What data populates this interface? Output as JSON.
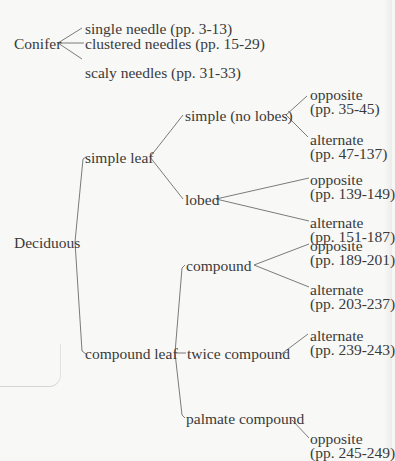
{
  "title_fragment": "",
  "tree": {
    "conifer": {
      "label": "Conifer",
      "children": [
        {
          "label": "single needle (pp. 3-13)"
        },
        {
          "label": "clustered needles (pp. 15-29)"
        },
        {
          "label": "scaly needles (pp. 31-33)"
        }
      ]
    },
    "deciduous": {
      "label": "Deciduous",
      "simple_leaf": {
        "label": "simple leaf",
        "no_lobes": {
          "label": "simple (no lobes)",
          "opposite": {
            "label": "opposite",
            "pages": "(pp. 35-45)"
          },
          "alternate": {
            "label": "alternate",
            "pages": "(pp. 47-137)"
          }
        },
        "lobed": {
          "label": "lobed",
          "opposite": {
            "label": "opposite",
            "pages": "(pp. 139-149)"
          },
          "alternate": {
            "label": "alternate",
            "pages": "(pp. 151-187)"
          }
        }
      },
      "compound_leaf": {
        "label": "compound leaf",
        "compound": {
          "label": "compound",
          "opposite": {
            "label": "opposite",
            "pages": "(pp. 189-201)"
          },
          "alternate": {
            "label": "alternate",
            "pages": "(pp. 203-237)"
          }
        },
        "twice_compound": {
          "label": "twice compound",
          "alternate": {
            "label": "alternate",
            "pages": "(pp. 239-243)"
          }
        },
        "palmate_compound": {
          "label": "palmate compound",
          "opposite": {
            "label": "opposite",
            "pages": "(pp. 245-249)"
          }
        }
      }
    }
  }
}
